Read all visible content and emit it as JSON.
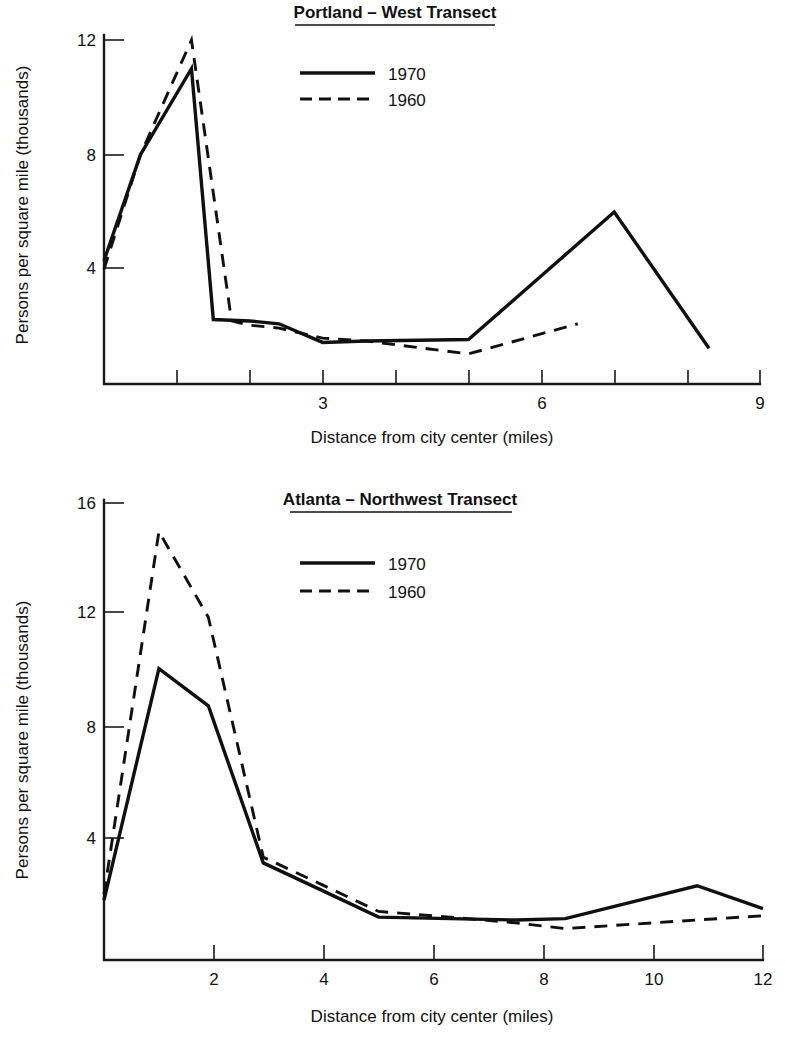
{
  "figure": {
    "background": "#ffffff",
    "ink_color": "#111111"
  },
  "chart_data": [
    {
      "type": "line",
      "id": "portland-west-transect",
      "title": "Portland – West Transect",
      "xlabel": "Distance from city center (miles)",
      "ylabel": "Persons per square mile  (thousands)",
      "xlim": [
        0,
        9
      ],
      "ylim": [
        0,
        13.2
      ],
      "xticks": [
        0,
        1,
        2,
        3,
        4,
        5,
        6,
        7,
        8,
        9
      ],
      "xtick_labels": [
        "",
        "",
        "",
        "3",
        "",
        "",
        "6",
        "",
        "",
        "9"
      ],
      "yticks": [
        4,
        8,
        12
      ],
      "ytick_labels": [
        "4",
        "8",
        "12"
      ],
      "grid": false,
      "legend_position": "upper-center",
      "series": [
        {
          "name": "1970",
          "style": "solid",
          "x": [
            0,
            0.5,
            1.2,
            1.5,
            2.0,
            2.4,
            3.0,
            3.6,
            5.0,
            7.0,
            8.3
          ],
          "y": [
            4.3,
            8.0,
            11.0,
            2.25,
            2.2,
            2.1,
            1.45,
            1.5,
            1.55,
            6.0,
            1.25
          ]
        },
        {
          "name": "1960",
          "style": "dashed",
          "x": [
            0,
            0.5,
            1.2,
            1.75,
            2.0,
            2.4,
            3.0,
            3.6,
            5.0,
            6.5
          ],
          "y": [
            4.0,
            8.0,
            12.0,
            2.2,
            2.05,
            1.95,
            1.6,
            1.5,
            1.05,
            2.1
          ]
        }
      ]
    },
    {
      "type": "line",
      "id": "atlanta-northwest-transect",
      "title": "Atlanta – Northwest Transect",
      "xlabel": "Distance from city center (miles)",
      "ylabel": "Persons per square mile  (thousands)",
      "xlim": [
        0,
        12
      ],
      "ylim": [
        0,
        17.0
      ],
      "xticks": [
        0,
        2,
        4,
        6,
        8,
        10,
        12
      ],
      "xtick_labels": [
        "",
        "2",
        "4",
        "6",
        "8",
        "10",
        "12"
      ],
      "yticks": [
        4,
        8,
        12,
        16
      ],
      "ytick_labels": [
        "4",
        "8",
        "12",
        "16"
      ],
      "grid": false,
      "legend_position": "upper-center",
      "series": [
        {
          "name": "1970",
          "style": "solid",
          "x": [
            0,
            1.0,
            1.9,
            2.9,
            3.9,
            5.0,
            6.3,
            7.5,
            8.4,
            10.8,
            12.0
          ],
          "y": [
            2.1,
            10.2,
            8.9,
            3.4,
            2.5,
            1.5,
            1.45,
            1.4,
            1.45,
            2.6,
            1.8
          ]
        },
        {
          "name": "1960",
          "style": "dashed",
          "x": [
            0,
            1.0,
            1.9,
            2.9,
            3.9,
            5.0,
            6.3,
            7.5,
            8.4,
            10.8,
            12.0
          ],
          "y": [
            2.3,
            15.0,
            12.0,
            3.6,
            2.7,
            1.7,
            1.5,
            1.3,
            1.1,
            1.4,
            1.55
          ]
        }
      ]
    }
  ],
  "panels": [
    {
      "key": "portland",
      "title": "Portland – West Transect",
      "ylabel": "Persons per square mile  (thousands)",
      "xlabel": "Distance from city center (miles)",
      "legend": [
        {
          "label": "1970",
          "style": "solid"
        },
        {
          "label": "1960",
          "style": "dashed"
        }
      ],
      "ytick_labels": [
        "12",
        "8",
        "4"
      ],
      "xtick_labels": [
        "3",
        "6",
        "9"
      ]
    },
    {
      "key": "atlanta",
      "title": "Atlanta – Northwest Transect",
      "ylabel": "Persons per square mile  (thousands)",
      "xlabel": "Distance from city center (miles)",
      "legend": [
        {
          "label": "1970",
          "style": "solid"
        },
        {
          "label": "1960",
          "style": "dashed"
        }
      ],
      "ytick_labels": [
        "16",
        "12",
        "8",
        "4"
      ],
      "xtick_labels": [
        "2",
        "4",
        "6",
        "8",
        "10",
        "12"
      ]
    }
  ]
}
